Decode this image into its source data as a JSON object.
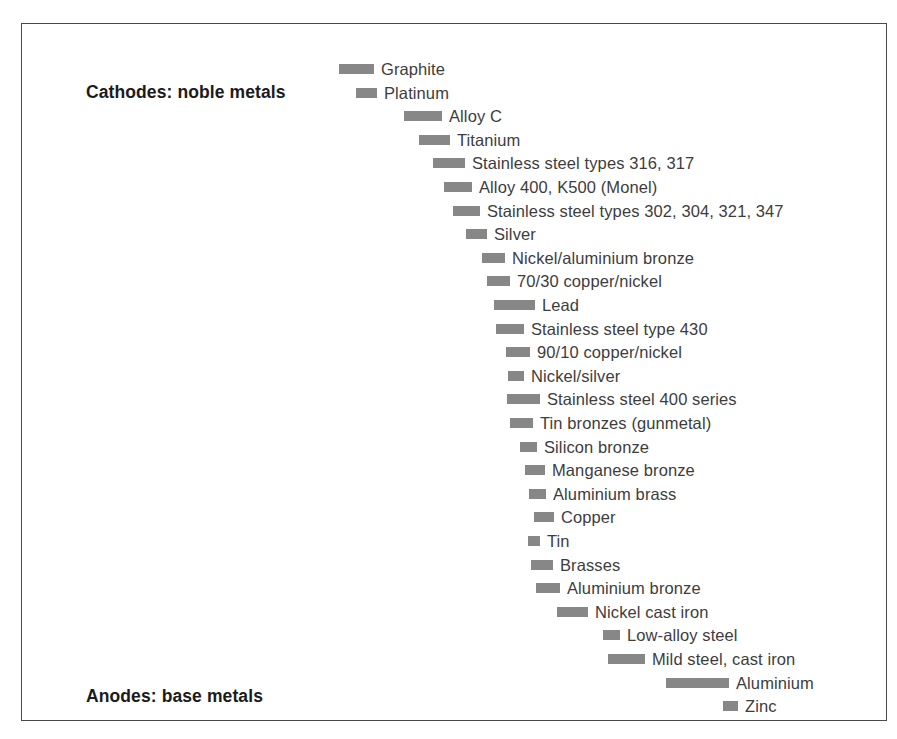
{
  "figure": {
    "background_color": "#ffffff",
    "frame_color": "#4a4a4a",
    "bar_color": "#878787",
    "label_color": "#3d3d3d",
    "heading_color": "#1b1b1b"
  },
  "headings": {
    "top": "Cathodes: noble metals",
    "bottom": "Anodes: base metals"
  },
  "chart_data": {
    "type": "bar",
    "title": "",
    "subtitle": "",
    "xlabel": "",
    "ylabel": "",
    "grid": false,
    "legend": "none",
    "orientation": "horizontal-floating",
    "axis_annotations": [
      "Cathodes: noble metals",
      "Anodes: base metals"
    ],
    "categories": [
      "Graphite",
      "Platinum",
      "Alloy C",
      "Titanium",
      "Stainless steel types 316, 317",
      "Alloy 400, K500 (Monel)",
      "Stainless steel types 302, 304, 321, 347",
      "Silver",
      "Nickel/aluminium bronze",
      "70/30 copper/nickel",
      "Lead",
      "Stainless steel type 430",
      "90/10 copper/nickel",
      "Nickel/silver",
      "Stainless steel 400 series",
      "Tin bronzes (gunmetal)",
      "Silicon bronze",
      "Manganese bronze",
      "Aluminium brass",
      "Copper",
      "Tin",
      "Brasses",
      "Aluminium bronze",
      "Nickel cast iron",
      "Low-alloy steel",
      "Mild steel, cast iron",
      "Aluminium",
      "Zinc"
    ],
    "bars": [
      {
        "label": "Graphite",
        "start": 317,
        "end": 352,
        "row": 0
      },
      {
        "label": "Platinum",
        "start": 334,
        "end": 355,
        "row": 1
      },
      {
        "label": "Alloy C",
        "start": 382,
        "end": 420,
        "row": 2
      },
      {
        "label": "Titanium",
        "start": 397,
        "end": 428,
        "row": 3
      },
      {
        "label": "Stainless steel types 316, 317",
        "start": 411,
        "end": 443,
        "row": 4
      },
      {
        "label": "Alloy 400, K500 (Monel)",
        "start": 422,
        "end": 450,
        "row": 5
      },
      {
        "label": "Stainless steel types 302, 304, 321, 347",
        "start": 431,
        "end": 458,
        "row": 6
      },
      {
        "label": "Silver",
        "start": 444,
        "end": 465,
        "row": 7
      },
      {
        "label": "Nickel/aluminium bronze",
        "start": 460,
        "end": 483,
        "row": 8
      },
      {
        "label": "70/30 copper/nickel",
        "start": 465,
        "end": 488,
        "row": 9
      },
      {
        "label": "Lead",
        "start": 472,
        "end": 513,
        "row": 10
      },
      {
        "label": "Stainless steel type 430",
        "start": 474,
        "end": 502,
        "row": 11
      },
      {
        "label": "90/10 copper/nickel",
        "start": 484,
        "end": 508,
        "row": 12
      },
      {
        "label": "Nickel/silver",
        "start": 486,
        "end": 502,
        "row": 13
      },
      {
        "label": "Stainless steel 400 series",
        "start": 485,
        "end": 518,
        "row": 14
      },
      {
        "label": "Tin bronzes (gunmetal)",
        "start": 488,
        "end": 511,
        "row": 15
      },
      {
        "label": "Silicon bronze",
        "start": 498,
        "end": 515,
        "row": 16
      },
      {
        "label": "Manganese bronze",
        "start": 503,
        "end": 523,
        "row": 17
      },
      {
        "label": "Aluminium brass",
        "start": 507,
        "end": 524,
        "row": 18
      },
      {
        "label": "Copper",
        "start": 512,
        "end": 532,
        "row": 19
      },
      {
        "label": "Tin",
        "start": 506,
        "end": 518,
        "row": 20
      },
      {
        "label": "Brasses",
        "start": 509,
        "end": 531,
        "row": 21
      },
      {
        "label": "Aluminium bronze",
        "start": 514,
        "end": 538,
        "row": 22
      },
      {
        "label": "Nickel cast iron",
        "start": 535,
        "end": 566,
        "row": 23
      },
      {
        "label": "Low-alloy steel",
        "start": 581,
        "end": 598,
        "row": 24
      },
      {
        "label": "Mild steel, cast iron",
        "start": 586,
        "end": 623,
        "row": 25
      },
      {
        "label": "Aluminium",
        "start": 644,
        "end": 707,
        "row": 26
      },
      {
        "label": "Zinc",
        "start": 701,
        "end": 716,
        "row": 27
      }
    ],
    "row_origin_y": 34,
    "row_pitch": 23.6
  }
}
